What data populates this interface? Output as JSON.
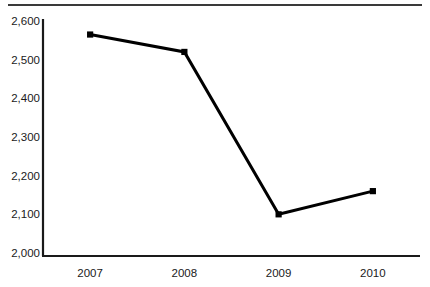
{
  "chart_data": {
    "type": "line",
    "title": "",
    "subtitle": "",
    "xlabel": "",
    "ylabel": "",
    "categories": [
      "2007",
      "2008",
      "2009",
      "2010"
    ],
    "values": [
      2565,
      2520,
      2100,
      2160
    ],
    "series": [
      {
        "name": "",
        "values": [
          2565,
          2520,
          2100,
          2160
        ]
      }
    ],
    "ylim": [
      2000,
      2600
    ],
    "ytick_labels": [
      "2,600",
      "2,500",
      "2,400",
      "2,300",
      "2,200",
      "2,100",
      "2,000"
    ],
    "ytick_values": [
      2600,
      2500,
      2400,
      2300,
      2200,
      2100,
      2000
    ],
    "xtick_labels": [
      "2007",
      "2008",
      "2009",
      "2010"
    ],
    "grid": false,
    "legend": "none",
    "marker": "square",
    "line_color": "#000000",
    "marker_color": "#000000",
    "axis_color": "#1a1a1a",
    "background_color": "#ffffff"
  },
  "figure": {
    "top_rule_color": "#3a3a3a"
  }
}
